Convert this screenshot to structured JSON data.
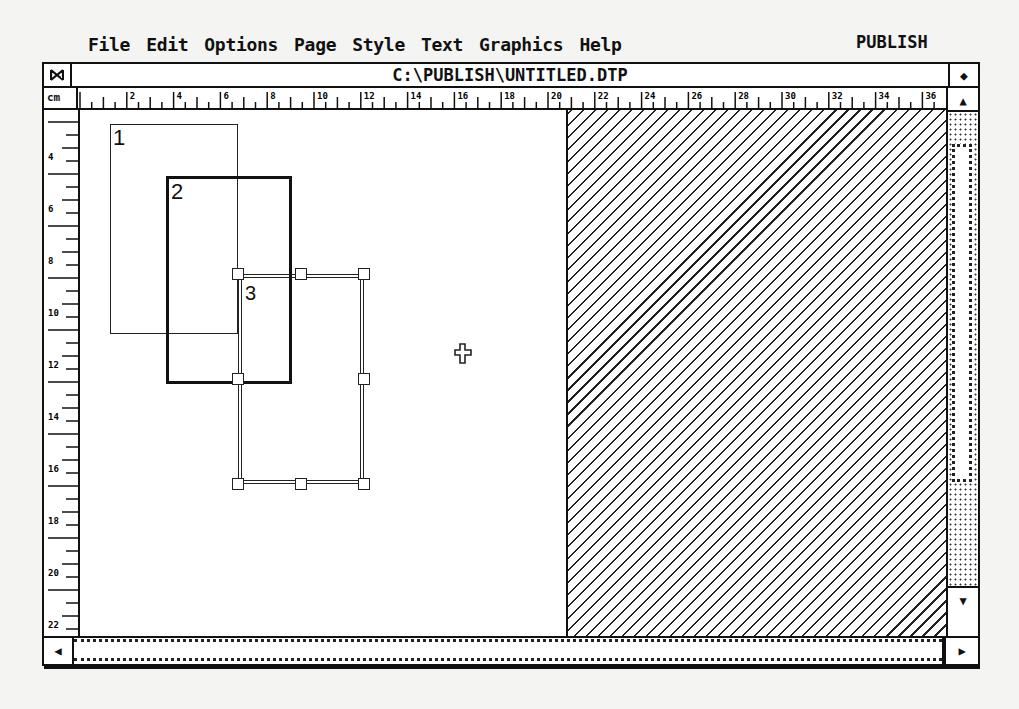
{
  "menubar": {
    "items": [
      "File",
      "Edit",
      "Options",
      "Page",
      "Style",
      "Text",
      "Graphics",
      "Help"
    ],
    "app_name": "PUBLISH"
  },
  "window": {
    "title": "C:\\PUBLISH\\UNTITLED.DTP",
    "close_glyph": "⧓",
    "full_glyph": "◆"
  },
  "rulers": {
    "unit": "cm",
    "horizontal_labels": [
      "2",
      "4",
      "6",
      "8",
      "10",
      "12",
      "14",
      "16",
      "18",
      "20",
      "22",
      "24",
      "26",
      "28",
      "30",
      "32",
      "34",
      "36"
    ],
    "vertical_labels": [
      "4",
      "6",
      "8",
      "10",
      "12",
      "14",
      "16",
      "18",
      "20",
      "22"
    ]
  },
  "frames": [
    {
      "label": "1"
    },
    {
      "label": "2"
    },
    {
      "label": "3"
    }
  ],
  "scrollbars": {
    "up": "▲",
    "down": "▼",
    "left": "◀",
    "right": "▶"
  },
  "colors": {
    "ink": "#111111",
    "paper": "#ffffff",
    "background": "#f4f4f2"
  }
}
